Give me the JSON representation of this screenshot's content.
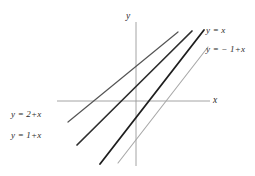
{
  "figure": {
    "background_color": "#ffffff",
    "width": 255,
    "height": 176
  },
  "axes": {
    "x_label": "x",
    "y_label": "y",
    "axis_color": "#9a9a9a",
    "origin": {
      "x": 136,
      "y": 101
    },
    "x_axis": {
      "x1": 57,
      "y1": 101,
      "x2": 210,
      "y2": 101
    },
    "y_axis": {
      "x1": 136,
      "y1": 22,
      "x2": 136,
      "y2": 166
    }
  },
  "labels": {
    "line_yx": "y = x",
    "line_ym1x": "y = − 1+x",
    "line_y2x": "y = 2+x",
    "line_y1x": "y = 1+x"
  },
  "chart_data": {
    "type": "line",
    "title": "",
    "xlabel": "x",
    "ylabel": "y",
    "grid": false,
    "legend": "inline-annotations",
    "xlim": [
      -4,
      3.5
    ],
    "ylim": [
      -3.5,
      3.5
    ],
    "series": [
      {
        "name": "y = 2+x",
        "slope": 1,
        "intercept": 2,
        "color": "#555555",
        "stroke_width": 1.2,
        "x": [
          -3.45,
          0.45
        ],
        "y": [
          -1.45,
          2.45
        ],
        "pixel_endpoints": {
          "x1": 68,
          "y1": 122,
          "x2": 178,
          "y2": 32
        },
        "label_position": "left"
      },
      {
        "name": "y = 1+x",
        "slope": 1,
        "intercept": 1,
        "color": "#2e2e2e",
        "stroke_width": 1.7,
        "x": [
          -3.1,
          0.8
        ],
        "y": [
          -2.1,
          1.8
        ],
        "pixel_endpoints": {
          "x1": 77,
          "y1": 145,
          "x2": 192,
          "y2": 31
        },
        "label_position": "left"
      },
      {
        "name": "y = x",
        "slope": 1,
        "intercept": 0,
        "color": "#1e1e1e",
        "stroke_width": 1.8,
        "x": [
          -2.6,
          1.3
        ],
        "y": [
          -2.6,
          1.3
        ],
        "pixel_endpoints": {
          "x1": 100,
          "y1": 164,
          "x2": 204,
          "y2": 30
        },
        "label_position": "right"
      },
      {
        "name": "y = − 1+x",
        "slope": 1,
        "intercept": -1,
        "color": "#a8a8a8",
        "stroke_width": 1.1,
        "x": [
          -2.1,
          1.8
        ],
        "y": [
          -3.1,
          0.8
        ],
        "pixel_endpoints": {
          "x1": 118,
          "y1": 163,
          "x2": 208,
          "y2": 47
        },
        "label_position": "right"
      }
    ]
  }
}
